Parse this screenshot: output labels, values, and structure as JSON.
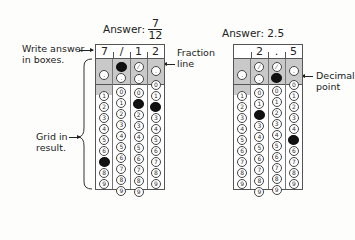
{
  "left": {
    "answer_label": "Answer:",
    "numerator": "7",
    "denominator": "12",
    "boxes": [
      "7",
      "/",
      "1",
      "2"
    ],
    "callouts": {
      "write_answer": [
        "Write answer",
        "in boxes."
      ],
      "fraction_line": [
        "Fraction",
        "line"
      ],
      "grid_in": [
        "Grid in",
        "result."
      ]
    },
    "columns": [
      {
        "slash": "none",
        "slash_filled": false,
        "decimal_filled": false,
        "has_zero": false,
        "filled_digit": 7
      },
      {
        "slash": "filled",
        "slash_filled": true,
        "decimal_filled": false,
        "has_zero": true,
        "filled_digit": null
      },
      {
        "slash": "bubble",
        "slash_filled": false,
        "decimal_filled": false,
        "has_zero": true,
        "filled_digit": 1
      },
      {
        "slash": "none",
        "slash_filled": false,
        "decimal_filled": false,
        "has_zero": true,
        "filled_digit": 2
      }
    ]
  },
  "right": {
    "answer_label": "Answer: 2.5",
    "boxes": [
      "",
      "2",
      ".",
      "5"
    ],
    "callouts": {
      "decimal_point": [
        "Decimal",
        "point"
      ]
    },
    "columns": [
      {
        "slash": "none",
        "decimal_filled": false,
        "has_zero": false,
        "filled_digit": null
      },
      {
        "slash": "bubble",
        "decimal_filled": false,
        "has_zero": true,
        "filled_digit": 2
      },
      {
        "slash": "bubble",
        "decimal_filled": true,
        "has_zero": true,
        "filled_digit": null
      },
      {
        "slash": "none",
        "decimal_filled": false,
        "has_zero": true,
        "filled_digit": 5
      }
    ]
  },
  "digits": [
    "0",
    "1",
    "2",
    "3",
    "4",
    "5",
    "6",
    "7",
    "8",
    "9"
  ],
  "symbols": {
    "slash": "⁄",
    "decimal": "."
  }
}
